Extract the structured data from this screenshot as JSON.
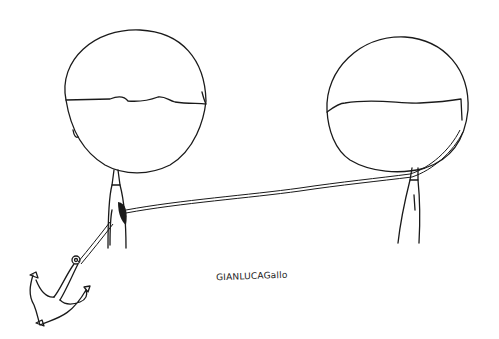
{
  "illustration": {
    "type": "line-art cartoon",
    "colors": {
      "background": "#ffffff",
      "ink": "#1a1a1a"
    },
    "figures": [
      {
        "name": "left-figure",
        "detail": "round head with bangs, anchor tied to chest"
      },
      {
        "name": "right-figure",
        "detail": "round head with bangs, rope wrapped around neck"
      }
    ],
    "signature": "GIANLUCAGallo"
  }
}
